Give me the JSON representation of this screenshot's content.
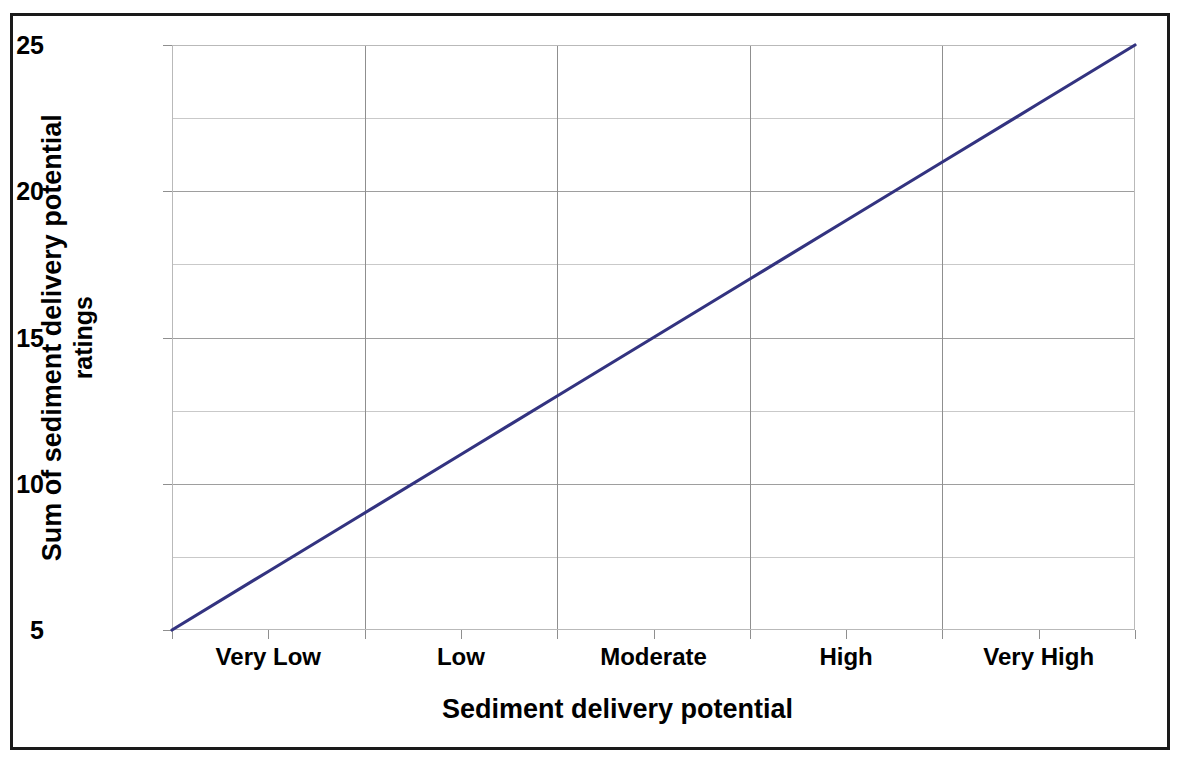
{
  "chart_data": {
    "type": "line",
    "title": "",
    "xlabel": "Sediment delivery potential",
    "ylabel": "Sum of sediment delivery potential ratings",
    "ylabel_lines": [
      "Sum of sediment delivery potential",
      "ratings"
    ],
    "categories": [
      "Very Low",
      "Low",
      "Moderate",
      "High",
      "Very High"
    ],
    "series": [
      {
        "name": "Sum of sediment delivery potential ratings",
        "color": "#333380",
        "x": [
          "Very Low",
          "Very High"
        ],
        "values": [
          5,
          25
        ]
      }
    ],
    "x": [
      0,
      1,
      2,
      3,
      4,
      5,
      6,
      7,
      8,
      9,
      10
    ],
    "y_at_x": [
      5,
      7,
      9,
      11,
      13,
      15,
      17,
      19,
      21,
      23,
      25
    ],
    "ylim": [
      5,
      25
    ],
    "ytick_labels": [
      "5",
      "10",
      "15",
      "20",
      "25"
    ],
    "ytick_values": [
      5,
      10,
      15,
      20,
      25
    ],
    "y_minor_gridline_values": [
      7.5,
      12.5,
      17.5,
      22.5
    ],
    "xtick_count": 11,
    "grid": true,
    "legend": "none",
    "line_color": "#333380",
    "gridline_color": "#9e9e9e",
    "axis_color": "#8f8f8f",
    "frame_color": "#1a1a1a",
    "background": "#ffffff"
  }
}
